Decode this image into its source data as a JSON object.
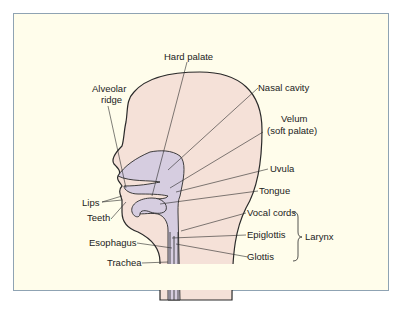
{
  "diagram": {
    "colors": {
      "background": "#fffdeb",
      "frame": "#8fa3b3",
      "head_fill": "#f5e1d8",
      "cavity_fill": "#d6cde0",
      "outline": "#2a2a2a"
    },
    "labels": {
      "hard_palate": "Hard palate",
      "alveolar_ridge_1": "Alveolar",
      "alveolar_ridge_2": "ridge",
      "nasal_cavity": "Nasal cavity",
      "velum_1": "Velum",
      "velum_2": "(soft palate)",
      "uvula": "Uvula",
      "tongue": "Tongue",
      "lips": "Lips",
      "teeth": "Teeth",
      "vocal_cords": "Vocal cords",
      "epiglottis": "Epiglottis",
      "glottis": "Glottis",
      "esophagus": "Esophagus",
      "trachea": "Trachea",
      "larynx": "Larynx"
    }
  }
}
